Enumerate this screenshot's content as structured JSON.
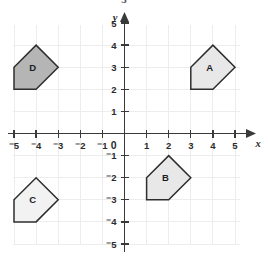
{
  "figure": {
    "title_fragment": "5",
    "background_color": "#ffffff",
    "grid_color": "#ededed",
    "axis_color": "#3a3a3a"
  },
  "axes": {
    "x_axis_name": "x",
    "y_axis_name": "y",
    "origin_label": "0",
    "x_min": -6,
    "x_max": 6,
    "y_min": -6,
    "y_max": 6,
    "x_tick_labels": [
      "⁻5",
      "⁻4",
      "⁻3",
      "⁻2",
      "⁻1",
      "1",
      "2",
      "3",
      "4",
      "5"
    ],
    "x_tick_values": [
      -5,
      -4,
      -3,
      -2,
      -1,
      1,
      2,
      3,
      4,
      5
    ],
    "y_tick_labels": [
      "5",
      "4",
      "3",
      "2",
      "1",
      "⁻1",
      "⁻2",
      "⁻3",
      "⁻4",
      "⁻5"
    ],
    "y_tick_values": [
      5,
      4,
      3,
      2,
      1,
      -1,
      -2,
      -3,
      -4,
      -5
    ],
    "grid_on": true
  },
  "chart_data": {
    "type": "scatter",
    "title": "",
    "xlabel": "x",
    "ylabel": "y",
    "xlim": [
      -6,
      6
    ],
    "ylim": [
      -6,
      6
    ],
    "grid": true,
    "legend": "none",
    "shapes": [
      {
        "label": "A",
        "fill": "#e8e8e8",
        "stroke": "#2e2e2e",
        "label_point": [
          3.85,
          3.0
        ],
        "vertices": [
          [
            3,
            2
          ],
          [
            3,
            3
          ],
          [
            4,
            4
          ],
          [
            5,
            3
          ],
          [
            4,
            2
          ]
        ]
      },
      {
        "label": "B",
        "fill": "#e8e8e8",
        "stroke": "#2e2e2e",
        "label_point": [
          1.85,
          -2.0
        ],
        "vertices": [
          [
            1,
            -3
          ],
          [
            1,
            -2
          ],
          [
            2,
            -1
          ],
          [
            3,
            -2
          ],
          [
            2,
            -3
          ]
        ]
      },
      {
        "label": "C",
        "fill": "#f2f2f2",
        "stroke": "#2e2e2e",
        "label_point": [
          -4.15,
          -3.0
        ],
        "vertices": [
          [
            -5,
            -4
          ],
          [
            -5,
            -3
          ],
          [
            -4,
            -2
          ],
          [
            -3,
            -3
          ],
          [
            -4,
            -4
          ]
        ]
      },
      {
        "label": "D",
        "fill": "#b5b5b5",
        "stroke": "#2e2e2e",
        "label_point": [
          -4.15,
          3.0
        ],
        "vertices": [
          [
            -5,
            2
          ],
          [
            -5,
            3
          ],
          [
            -4,
            4
          ],
          [
            -3,
            3
          ],
          [
            -4,
            2
          ]
        ]
      }
    ]
  }
}
